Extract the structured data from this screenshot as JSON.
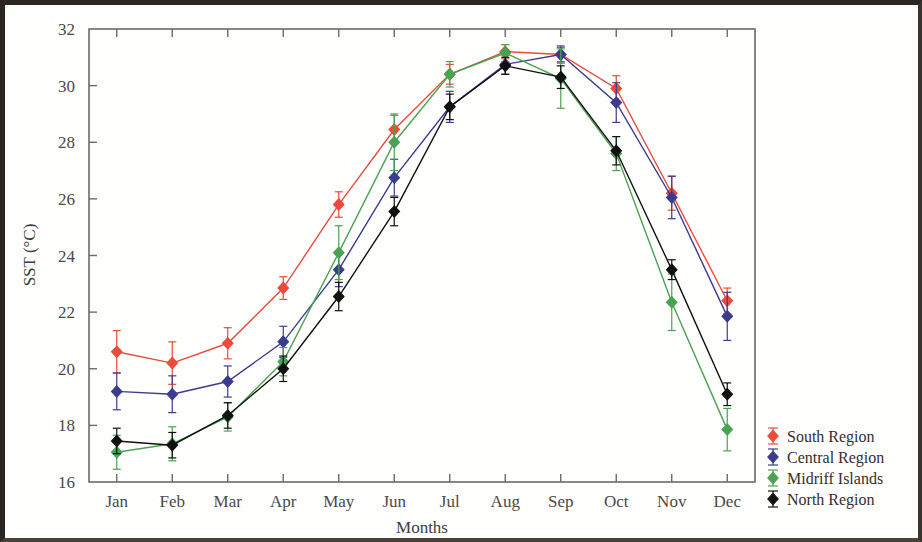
{
  "chart_data": {
    "type": "line",
    "title": "",
    "xlabel": "Months",
    "ylabel": "SST (°C)",
    "categories": [
      "Jan",
      "Feb",
      "Mar",
      "Apr",
      "May",
      "Jun",
      "Jul",
      "Aug",
      "Sep",
      "Oct",
      "Nov",
      "Dec"
    ],
    "ylim": [
      16,
      32
    ],
    "yticks": [
      16,
      18,
      20,
      22,
      24,
      26,
      28,
      30,
      32
    ],
    "ytick_labels": [
      "16",
      "18",
      "20",
      "22",
      "24",
      "26",
      "28",
      "30",
      "32"
    ],
    "grid": false,
    "legend_position": "right",
    "error_bars": true,
    "series": [
      {
        "name": "South Region",
        "color": "#ea4b3c",
        "values": [
          20.6,
          20.2,
          20.9,
          22.85,
          25.8,
          28.45,
          30.4,
          31.2,
          31.1,
          29.9,
          26.2,
          22.4
        ],
        "errors": [
          0.75,
          0.75,
          0.55,
          0.4,
          0.45,
          0.5,
          0.35,
          0.25,
          0.25,
          0.45,
          0.6,
          0.45
        ]
      },
      {
        "name": "Central Region",
        "color": "#3c3c8e",
        "values": [
          19.2,
          19.1,
          19.55,
          20.95,
          23.5,
          26.75,
          29.25,
          30.75,
          31.1,
          29.4,
          26.05,
          21.85
        ],
        "errors": [
          0.65,
          0.65,
          0.55,
          0.55,
          0.6,
          0.65,
          0.55,
          0.35,
          0.3,
          0.7,
          0.75,
          0.85
        ]
      },
      {
        "name": "Midriff Islands",
        "color": "#4aa352",
        "values": [
          17.05,
          17.35,
          18.3,
          20.25,
          24.1,
          28.0,
          30.4,
          31.15,
          30.25,
          27.6,
          22.35,
          17.85
        ],
        "errors": [
          0.6,
          0.6,
          0.5,
          0.5,
          0.95,
          1.0,
          0.45,
          0.3,
          1.05,
          0.6,
          1.0,
          0.75
        ]
      },
      {
        "name": "North Region",
        "color": "#111111",
        "values": [
          17.45,
          17.3,
          18.35,
          20.0,
          22.55,
          25.55,
          29.25,
          30.7,
          30.3,
          27.7,
          23.5,
          19.1
        ],
        "errors": [
          0.45,
          0.45,
          0.45,
          0.45,
          0.5,
          0.5,
          0.45,
          0.3,
          0.4,
          0.5,
          0.35,
          0.4
        ]
      }
    ]
  },
  "legend": {
    "entries": [
      {
        "label": "South Region"
      },
      {
        "label": "Central Region"
      },
      {
        "label": "Midriff Islands"
      },
      {
        "label": "North Region"
      }
    ]
  }
}
